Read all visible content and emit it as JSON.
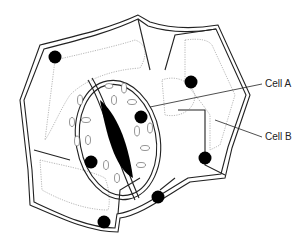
{
  "figure": {
    "labels": [
      {
        "id": "cell-a",
        "text": "Cell A"
      },
      {
        "id": "cell-b",
        "text": "Cell B"
      }
    ]
  },
  "colors": {
    "line": "#222222",
    "nucleus": "#000000",
    "stoma_pore": "#000000",
    "membrane": "#888888",
    "background": "#ffffff"
  }
}
